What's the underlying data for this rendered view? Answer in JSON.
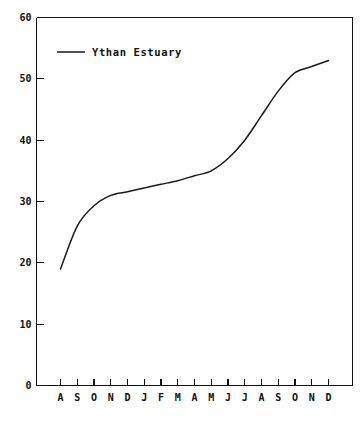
{
  "chart_data": {
    "type": "line",
    "title": "",
    "xlabel": "",
    "ylabel": "",
    "ylim": [
      0,
      60
    ],
    "yticks": [
      0,
      10,
      20,
      30,
      40,
      50,
      60
    ],
    "grid": false,
    "legend_position": "top-left",
    "categories": [
      "A",
      "S",
      "O",
      "N",
      "D",
      "J",
      "F",
      "M",
      "A",
      "M",
      "J",
      "J",
      "A",
      "S",
      "O",
      "N",
      "D"
    ],
    "series": [
      {
        "name": "Ythan Estuary",
        "color": "#1a1a1a",
        "values": [
          19,
          26,
          29.3,
          31,
          31.6,
          32.2,
          32.8,
          33.4,
          34.2,
          35,
          37,
          40,
          44,
          48,
          51,
          52,
          53
        ]
      }
    ]
  },
  "legend": {
    "entries": [
      {
        "label": "Ythan Estuary",
        "color": "#1a1a1a"
      }
    ]
  },
  "axes": {
    "y_tick_labels": [
      "60",
      "50",
      "40",
      "30",
      "20",
      "10",
      "0"
    ],
    "x_tick_labels": [
      "A",
      "S",
      "O",
      "N",
      "D",
      "J",
      "F",
      "M",
      "A",
      "M",
      "J",
      "J",
      "A",
      "S",
      "O",
      "N",
      "D"
    ]
  }
}
